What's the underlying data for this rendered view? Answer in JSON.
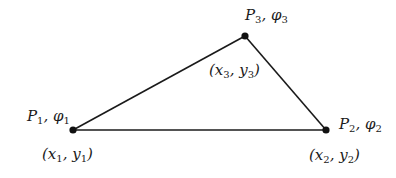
{
  "diagram": {
    "type": "triangle-element",
    "colors": {
      "line": "#1a1a1a",
      "node": "#111111",
      "background": "#ffffff"
    },
    "nodes": [
      {
        "id": "P1",
        "point": "P",
        "sub": "1",
        "phi": "φ",
        "coord_x": "x",
        "coord_y": "y",
        "x": 73,
        "y": 130
      },
      {
        "id": "P2",
        "point": "P",
        "sub": "2",
        "phi": "φ",
        "coord_x": "x",
        "coord_y": "y",
        "x": 326,
        "y": 130
      },
      {
        "id": "P3",
        "point": "P",
        "sub": "3",
        "phi": "φ",
        "coord_x": "x",
        "coord_y": "y",
        "x": 245,
        "y": 36
      }
    ],
    "edges": [
      [
        "P1",
        "P3"
      ],
      [
        "P3",
        "P2"
      ],
      [
        "P1",
        "P2"
      ]
    ]
  },
  "labels": {
    "p1": {
      "P": "P",
      "sub": "1",
      "sep": ", ",
      "phi": "φ",
      "phisub": "1"
    },
    "p1c": {
      "open": "(",
      "x": "x",
      "xs": "1",
      "sep": ", ",
      "y": "y",
      "ys": "1",
      "close": ")"
    },
    "p2": {
      "P": "P",
      "sub": "2",
      "sep": ", ",
      "phi": "φ",
      "phisub": "2"
    },
    "p2c": {
      "open": "(",
      "x": "x",
      "xs": "2",
      "sep": ", ",
      "y": "y",
      "ys": "2",
      "close": ")"
    },
    "p3": {
      "P": "P",
      "sub": "3",
      "sep": ", ",
      "phi": "φ",
      "phisub": "3"
    },
    "p3c": {
      "open": "(",
      "x": "x",
      "xs": "3",
      "sep": ", ",
      "y": "y",
      "ys": "3",
      "close": ")"
    }
  }
}
